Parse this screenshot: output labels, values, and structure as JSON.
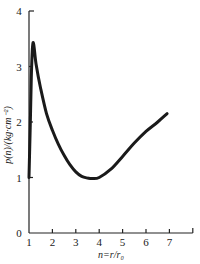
{
  "chart_data": {
    "type": "line",
    "title": "",
    "xlabel": "n=r/r₀",
    "ylabel": "p(n)/(kg·cm⁻²)",
    "xlim": [
      1,
      8
    ],
    "ylim": [
      0,
      4
    ],
    "x_ticks": [
      "1",
      "2",
      "3",
      "4",
      "5",
      "6",
      "7"
    ],
    "y_ticks": [
      "0",
      "1",
      "2",
      "3",
      "4"
    ],
    "grid": false,
    "legend": null,
    "series": [
      {
        "name": "p(n)",
        "color": "#1a1a1a",
        "x": [
          1.0,
          1.05,
          1.1,
          1.15,
          1.2,
          1.3,
          1.5,
          1.75,
          2.0,
          2.25,
          2.5,
          2.75,
          3.0,
          3.25,
          3.5,
          3.7,
          4.0,
          4.5,
          5.0,
          5.5,
          6.0,
          6.5,
          6.9
        ],
        "y": [
          1.0,
          1.9,
          2.8,
          3.35,
          3.4,
          3.05,
          2.6,
          2.15,
          1.85,
          1.6,
          1.4,
          1.23,
          1.1,
          1.02,
          0.99,
          0.98,
          1.0,
          1.15,
          1.38,
          1.62,
          1.83,
          2.0,
          2.15
        ]
      }
    ]
  }
}
